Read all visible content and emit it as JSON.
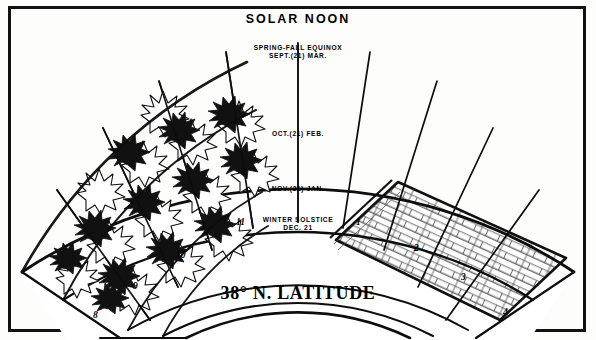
{
  "figure": {
    "title": "SOLAR NOON",
    "caption": "38° N. LATITUDE"
  },
  "season_bands": [
    {
      "id": "equinox",
      "line1": "SPRING-FALL EQUINOX",
      "line2": "SEPT.(21) MAR."
    },
    {
      "id": "oct_feb",
      "line1": "OCT.(21) FEB.",
      "line2": ""
    },
    {
      "id": "nov_jan",
      "line1": "NOV.(21) JAN.",
      "line2": ""
    },
    {
      "id": "solstice",
      "line1": "WINTER SOLSTICE",
      "line2": "DEC. 21"
    }
  ],
  "hour_labels": [
    {
      "label": "8",
      "x": 93,
      "y": 310
    },
    {
      "label": "9",
      "x": 133,
      "y": 281
    },
    {
      "label": "10",
      "x": 176,
      "y": 250
    },
    {
      "label": "11",
      "x": 236,
      "y": 217
    },
    {
      "label": "1",
      "x": 356,
      "y": 217
    },
    {
      "label": "2",
      "x": 414,
      "y": 243
    },
    {
      "label": "3",
      "x": 461,
      "y": 272
    },
    {
      "label": "4",
      "x": 503,
      "y": 307
    }
  ],
  "regions": [
    {
      "id": "tree-shading-region",
      "name": "deciduous tree canopy (morning / east side)"
    },
    {
      "id": "brick-wall-region",
      "name": "masonry brick wall (afternoon / west side)"
    }
  ],
  "chart_data": {
    "type": "line",
    "title": "SOLAR NOON",
    "subtitle": "38° N. LATITUDE",
    "xlabel": "Solar hour",
    "ylabel": "Solar altitude",
    "x": [
      "8",
      "9",
      "10",
      "11",
      "SOLAR NOON",
      "1",
      "2",
      "3",
      "4"
    ],
    "series": [
      {
        "name": "SPRING-FALL EQUINOX SEPT.(21) MAR.",
        "values": [
          22,
          34,
          44,
          50,
          52,
          50,
          44,
          34,
          22
        ]
      },
      {
        "name": "OCT.(21) FEB.",
        "values": [
          14,
          25,
          34,
          39,
          41,
          39,
          34,
          25,
          14
        ]
      },
      {
        "name": "NOV.(21) JAN.",
        "values": [
          8,
          18,
          26,
          31,
          32,
          31,
          26,
          18,
          8
        ]
      },
      {
        "name": "WINTER SOLSTICE DEC. 21",
        "values": [
          5,
          14,
          22,
          27,
          28,
          27,
          22,
          14,
          5
        ]
      }
    ],
    "legend": [
      "SPRING-FALL EQUINOX SEPT.(21) MAR.",
      "OCT.(21) FEB.",
      "NOV.(21) JAN.",
      "WINTER SOLSTICE DEC. 21"
    ],
    "grid": true,
    "legend_position": "inline-on-arcs",
    "annotations": [
      "deciduous tree canopy shades the morning / east side",
      "masonry brick wall on the afternoon / west side"
    ]
  }
}
